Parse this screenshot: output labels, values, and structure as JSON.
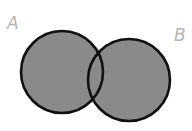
{
  "diagram": {
    "type": "venn",
    "sets": [
      {
        "label": "A",
        "cx": 62,
        "cy": 72,
        "r": 41,
        "shaded": true
      },
      {
        "label": "B",
        "cx": 129,
        "cy": 80,
        "r": 41,
        "shaded": true
      }
    ],
    "shaded_region": "A ∪ B",
    "colors": {
      "fill": "#8a8a8a",
      "stroke": "#111111",
      "label": "#b4b4b4",
      "background": "#ffffff"
    }
  }
}
